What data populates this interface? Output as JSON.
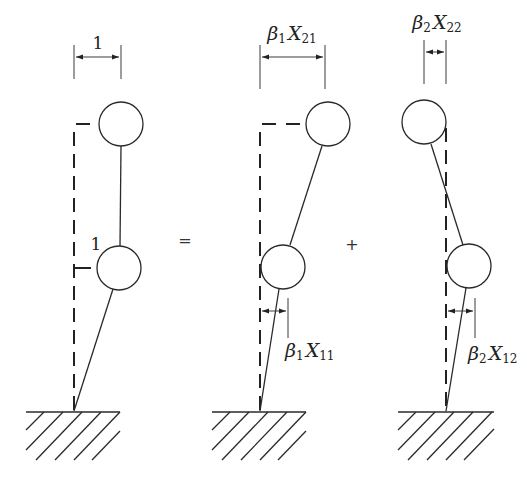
{
  "diagram": {
    "type": "mode-superposition-of-two-mass-cantilever",
    "figures": [
      {
        "id": "total",
        "top_dimension_label": "1",
        "mid_label": "1",
        "description": "Two-mass cantilever deflected shape with unit displacements at both masses"
      },
      {
        "id": "mode1",
        "top_dimension": {
          "coef": "β",
          "coef_sub": "1",
          "var": "X",
          "var_sub": "21"
        },
        "bottom_dimension": {
          "coef": "β",
          "coef_sub": "1",
          "var": "X",
          "var_sub": "11"
        },
        "description": "First mode shape contribution"
      },
      {
        "id": "mode2",
        "top_dimension": {
          "coef": "β",
          "coef_sub": "2",
          "var": "X",
          "var_sub": "22"
        },
        "bottom_dimension": {
          "coef": "β",
          "coef_sub": "2",
          "var": "X",
          "var_sub": "12"
        },
        "description": "Second mode shape contribution"
      }
    ],
    "operators": {
      "equals": "=",
      "plus": "+"
    },
    "colors": {
      "stroke": "#2a2a2a",
      "background": "#ffffff"
    }
  }
}
